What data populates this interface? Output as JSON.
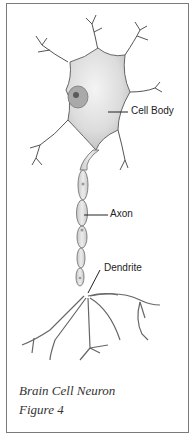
{
  "figure": {
    "labels": {
      "cell_body": "Cell Body",
      "axon": "Axon",
      "dendrite": "Dendrite"
    },
    "caption": {
      "line1": "Brain Cell Neuron",
      "line2": "Figure  4"
    }
  }
}
